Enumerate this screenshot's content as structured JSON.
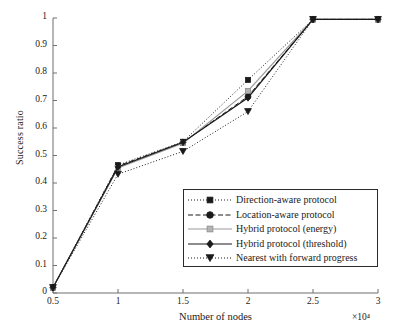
{
  "chart_data": {
    "type": "line",
    "title": "",
    "xlabel": "Number of nodes",
    "ylabel": "Success ratio",
    "x_multiplier": "×10⁴",
    "x": [
      0.5,
      1,
      1.5,
      2,
      2.5,
      3
    ],
    "xlim": [
      0.5,
      3
    ],
    "ylim": [
      0,
      1
    ],
    "xticks": [
      "0.5",
      "1",
      "1.5",
      "2",
      "2.5",
      "3"
    ],
    "yticks": [
      "0",
      "0.1",
      "0.2",
      "0.3",
      "0.4",
      "0.5",
      "0.6",
      "0.7",
      "0.8",
      "0.9",
      "1"
    ],
    "grid": false,
    "legend_position": "lower right",
    "series": [
      {
        "name": "Direction-aware protocol",
        "marker": "square",
        "linestyle": "dotted",
        "color": "#1a1a1a",
        "values": [
          0.02,
          0.465,
          0.55,
          0.775,
          0.995,
          0.995
        ]
      },
      {
        "name": "Location-aware protocol",
        "marker": "circle",
        "linestyle": "dashed",
        "color": "#1a1a1a",
        "values": [
          0.02,
          0.462,
          0.548,
          0.715,
          0.995,
          0.995
        ]
      },
      {
        "name": "Hybrid protocol (energy)",
        "marker": "square-light",
        "linestyle": "solid",
        "color": "#9a9a9a",
        "values": [
          0.02,
          0.455,
          0.545,
          0.735,
          0.995,
          0.995
        ]
      },
      {
        "name": "Hybrid protocol (threshold)",
        "marker": "diamond",
        "linestyle": "solid",
        "color": "#1a1a1a",
        "values": [
          0.02,
          0.458,
          0.548,
          0.71,
          0.995,
          0.995
        ]
      },
      {
        "name": "Nearest with forward progress",
        "marker": "triangle-down",
        "linestyle": "dotted",
        "color": "#1a1a1a",
        "values": [
          0.02,
          0.432,
          0.515,
          0.66,
          0.995,
          0.995
        ]
      }
    ]
  }
}
